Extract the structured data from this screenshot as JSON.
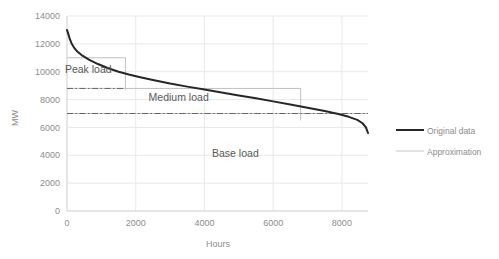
{
  "chart_data": {
    "type": "line",
    "title": "",
    "xlabel": "Hours",
    "ylabel": "MW",
    "xlim": [
      0,
      8760
    ],
    "ylim": [
      0,
      14000
    ],
    "grid": true,
    "legend_position": "right",
    "xticks": [
      "0",
      "2000",
      "4000",
      "6000",
      "8000"
    ],
    "xtick_values": [
      0,
      2000,
      4000,
      6000,
      8000
    ],
    "yticks": [
      "0",
      "2000",
      "4000",
      "6000",
      "8000",
      "10000",
      "12000",
      "14000"
    ],
    "ytick_values": [
      0,
      2000,
      4000,
      6000,
      8000,
      10000,
      12000,
      14000
    ],
    "series": [
      {
        "name": "Original data",
        "color": "#262626",
        "style": "solid",
        "width": 2.0,
        "x": [
          0,
          40,
          80,
          130,
          200,
          300,
          450,
          650,
          900,
          1200,
          1500,
          1800,
          2100,
          2500,
          3000,
          3500,
          4000,
          4500,
          5000,
          5500,
          6000,
          6500,
          7000,
          7500,
          7900,
          8200,
          8450,
          8600,
          8700,
          8760
        ],
        "y": [
          13000,
          12700,
          12350,
          12050,
          11750,
          11450,
          11150,
          10850,
          10550,
          10250,
          10000,
          9800,
          9620,
          9400,
          9150,
          8930,
          8720,
          8510,
          8300,
          8090,
          7870,
          7650,
          7420,
          7180,
          6960,
          6760,
          6540,
          6300,
          6000,
          5600
        ]
      },
      {
        "name": "Approximation",
        "color": "#bfbfbf",
        "style": "step",
        "width": 1.0,
        "steps": [
          {
            "label": "Peak load",
            "from_hour": 0,
            "to_hour": 1700,
            "level_mw": 11000
          },
          {
            "label": "Medium load",
            "from_hour": 0,
            "to_hour": 6800,
            "level_mw": 8800
          },
          {
            "label": "Base load",
            "from_hour": 0,
            "to_hour": 8760,
            "level_mw": 7000
          }
        ]
      }
    ],
    "level_lines": [
      {
        "label": "peak-lower-bound",
        "value_mw": 8800,
        "from_hour": 0,
        "to_hour": 1700,
        "style": "dash-dot",
        "color": "#595959"
      },
      {
        "label": "base-level",
        "value_mw": 7000,
        "from_hour": 0,
        "to_hour": 8760,
        "style": "dash-dot",
        "color": "#595959"
      }
    ],
    "annotations": [
      {
        "text": "Peak load",
        "hour": 620,
        "mw": 9900
      },
      {
        "text": "Medium load",
        "hour": 3250,
        "mw": 7900
      },
      {
        "text": "Base load",
        "hour": 4900,
        "mw": 3900
      }
    ]
  },
  "legend": {
    "entries": [
      {
        "label": "Original data",
        "color": "#262626",
        "width": 2.0
      },
      {
        "label": "Approximation",
        "color": "#d0d0d0",
        "width": 1.0
      }
    ]
  },
  "colors": {
    "gridline": "#e8e8e8",
    "axisline": "#d9d9d9",
    "original": "#262626",
    "approximation": "#c9c9c9",
    "text": "#8c8c8c",
    "annotation_text": "#595959",
    "background": "#ffffff"
  }
}
